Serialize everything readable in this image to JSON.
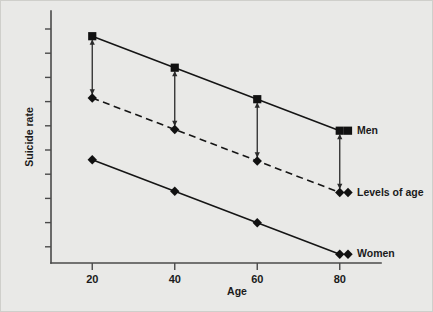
{
  "figure": {
    "background_color": "#e9e9e7",
    "border_color": "#cfcfcb",
    "ink_color": "#111111",
    "axis_color": "#4a4a4a"
  },
  "axes": {
    "x_label": "Age",
    "y_label": "Suicide rate",
    "x_tick_labels": [
      "20",
      "40",
      "60",
      "80"
    ],
    "y_tick_labels": []
  },
  "series_labels": {
    "men": "Men",
    "levels_of_age": "Levels of age",
    "women": "Women"
  },
  "chart_data": {
    "type": "line",
    "title": "",
    "xlabel": "Age",
    "ylabel": "Suicide rate",
    "x": [
      20,
      40,
      60,
      80
    ],
    "categories": [
      "20",
      "40",
      "60",
      "80"
    ],
    "xlim": [
      10,
      90
    ],
    "ylim": [
      0,
      10
    ],
    "grid": false,
    "legend_position": "right-inline",
    "x_tick_labels": [
      "20",
      "40",
      "60",
      "80"
    ],
    "y_tick_labels": [],
    "y_axis_ticks_unlabeled": 10,
    "series": [
      {
        "name": "Men",
        "marker": "square",
        "linestyle": "solid",
        "values": [
          9.0,
          7.75,
          6.5,
          5.25
        ]
      },
      {
        "name": "Levels of age",
        "marker": "diamond",
        "linestyle": "dashed",
        "values": [
          6.55,
          5.3,
          4.05,
          2.8
        ]
      },
      {
        "name": "Women",
        "marker": "diamond",
        "linestyle": "solid",
        "values": [
          4.1,
          2.85,
          1.6,
          0.35
        ]
      }
    ],
    "annotations": [
      {
        "type": "double-headed-arrow",
        "x": 20,
        "y_from": 9.0,
        "y_to": 6.55,
        "note": "vertical gap between Men and Levels of age at age 20"
      },
      {
        "type": "double-headed-arrow",
        "x": 40,
        "y_from": 7.75,
        "y_to": 5.3,
        "note": "vertical gap between Men and Levels of age at age 40"
      },
      {
        "type": "double-headed-arrow",
        "x": 60,
        "y_from": 6.5,
        "y_to": 4.05,
        "note": "vertical gap between Men and Levels of age at age 60"
      },
      {
        "type": "double-headed-arrow",
        "x": 80,
        "y_from": 5.25,
        "y_to": 2.8,
        "note": "vertical gap between Men and Levels of age at age 80"
      }
    ]
  }
}
